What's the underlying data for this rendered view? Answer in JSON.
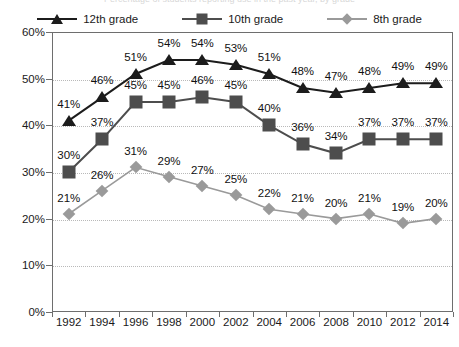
{
  "title_sliver": "Percentage of students reporting use in the past year, by grade",
  "legend": {
    "position": "top-center",
    "items": [
      {
        "label": "12th grade",
        "marker": "triangle-icon",
        "color": "#1c1c1c"
      },
      {
        "label": "10th grade",
        "marker": "square-icon",
        "color": "#4d4d4d"
      },
      {
        "label": "8th grade",
        "marker": "diamond-icon",
        "color": "#9a9a9a"
      }
    ]
  },
  "axes": {
    "y_ticks": [
      "0%",
      "10%",
      "20%",
      "30%",
      "40%",
      "50%",
      "60%"
    ],
    "x_ticks": [
      "1992",
      "1994",
      "1996",
      "1998",
      "2000",
      "2002",
      "2004",
      "2006",
      "2008",
      "2010",
      "2012",
      "2014"
    ]
  },
  "chart_data": {
    "type": "line",
    "title": "",
    "xlabel": "",
    "ylabel": "",
    "ylim": [
      0,
      60
    ],
    "ytick_step": 10,
    "ytick_format": "percent",
    "grid": true,
    "legend_position": "top-center",
    "x": [
      1992,
      1994,
      1996,
      1998,
      2000,
      2002,
      2004,
      2006,
      2008,
      2010,
      2012,
      2014
    ],
    "categories": [
      "1992",
      "1994",
      "1996",
      "1998",
      "2000",
      "2002",
      "2004",
      "2006",
      "2008",
      "2010",
      "2012",
      "2014"
    ],
    "series": [
      {
        "name": "12th grade",
        "marker": "triangle",
        "color": "#1c1c1c",
        "values": [
          41,
          46,
          51,
          54,
          54,
          53,
          51,
          48,
          47,
          48,
          49,
          49
        ],
        "labels": [
          "41%",
          "46%",
          "51%",
          "54%",
          "54%",
          "53%",
          "51%",
          "48%",
          "47%",
          "48%",
          "49%",
          "49%"
        ]
      },
      {
        "name": "10th grade",
        "marker": "square",
        "color": "#4d4d4d",
        "values": [
          30,
          37,
          45,
          45,
          46,
          45,
          40,
          36,
          34,
          37,
          37,
          37
        ],
        "labels": [
          "30%",
          "37%",
          "45%",
          "45%",
          "46%",
          "45%",
          "40%",
          "36%",
          "34%",
          "37%",
          "37%",
          "37%"
        ]
      },
      {
        "name": "8th grade",
        "marker": "diamond",
        "color": "#9a9a9a",
        "values": [
          21,
          26,
          31,
          29,
          27,
          25,
          22,
          21,
          20,
          21,
          19,
          20
        ],
        "labels": [
          "21%",
          "26%",
          "31%",
          "29%",
          "27%",
          "25%",
          "22%",
          "21%",
          "20%",
          "21%",
          "19%",
          "20%"
        ]
      }
    ]
  }
}
